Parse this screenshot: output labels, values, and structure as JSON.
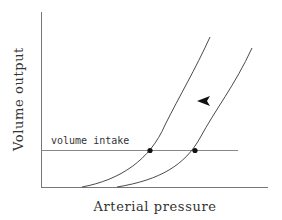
{
  "diagram": {
    "axes": {
      "y_label": "Volume output",
      "x_label": "Arterial pressure"
    },
    "reference_line": {
      "label": "volume intake"
    },
    "curves": [
      {
        "name": "output-curve-left"
      },
      {
        "name": "output-curve-right"
      }
    ],
    "equilibrium_points": [
      {
        "name": "equilibrium-left"
      },
      {
        "name": "equilibrium-right"
      }
    ],
    "arrow": {
      "direction": "left",
      "meaning": "shift of curve toward lower pressure"
    },
    "colors": {
      "axis": "#777777",
      "curve": "#4a4a4a",
      "points": "#111111",
      "text": "#333333"
    }
  }
}
